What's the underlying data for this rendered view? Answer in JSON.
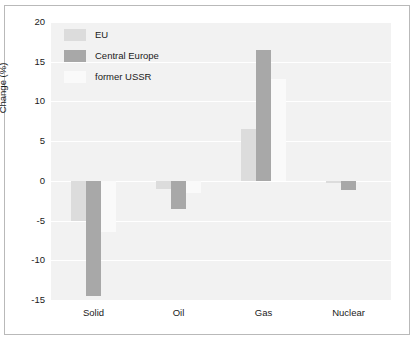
{
  "chart_data": {
    "type": "bar",
    "title": "",
    "xlabel": "",
    "ylabel": "Change (%)",
    "categories": [
      "Solid",
      "Oil",
      "Gas",
      "Nuclear"
    ],
    "ylim": [
      -15,
      20
    ],
    "yticks": [
      20,
      15,
      10,
      5,
      0,
      -5,
      -10,
      -15
    ],
    "ytick_labels": [
      "20",
      "15",
      "10",
      "5",
      "0",
      "-5",
      "-10",
      "-15"
    ],
    "grid": true,
    "legend_position": "top-left-inside",
    "series": [
      {
        "name": "EU",
        "color": "#dcdcdc",
        "values": [
          -5.0,
          -1.0,
          6.5,
          -0.3
        ]
      },
      {
        "name": "Central Europe",
        "color": "#a8a8a8",
        "values": [
          -14.5,
          -3.5,
          16.5,
          -1.2
        ]
      },
      {
        "name": "former USSR",
        "color": "#fafafa",
        "values": [
          -6.5,
          -1.5,
          12.8,
          0.0
        ]
      }
    ]
  },
  "figure": {
    "background": "#ffffff",
    "plot_background": "#f2f2f2",
    "grid_color": "#ffffff",
    "border_color": "#b9b9b9",
    "text_color": "#1a1a1a"
  }
}
